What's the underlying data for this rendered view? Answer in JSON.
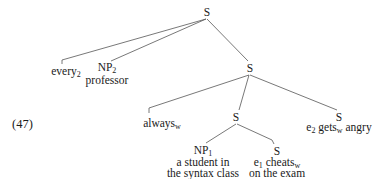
{
  "example": {
    "number": "(47)"
  },
  "tree": {
    "root": {
      "label": "S"
    },
    "every": {
      "text": "every",
      "sub": "2"
    },
    "np2": {
      "label": "NP",
      "sub": "2",
      "word": "professor"
    },
    "s2": {
      "label": "S"
    },
    "always": {
      "text": "always",
      "sub": "w"
    },
    "s3": {
      "label": "S"
    },
    "s_gets": {
      "label": "S",
      "e": "e",
      "e_sub": "2",
      "verb": " gets",
      "verb_sub": "w",
      "rest": " angry"
    },
    "np1": {
      "label": "NP",
      "sub": "1",
      "line1": "a student in",
      "line2": "the syntax class"
    },
    "s_cheats": {
      "label": "S",
      "e": "e",
      "e_sub": "1",
      "verb": " cheats",
      "verb_sub": "w",
      "line2": "on the exam"
    }
  },
  "colors": {
    "line": "#555555",
    "text": "#1a1a1a"
  }
}
